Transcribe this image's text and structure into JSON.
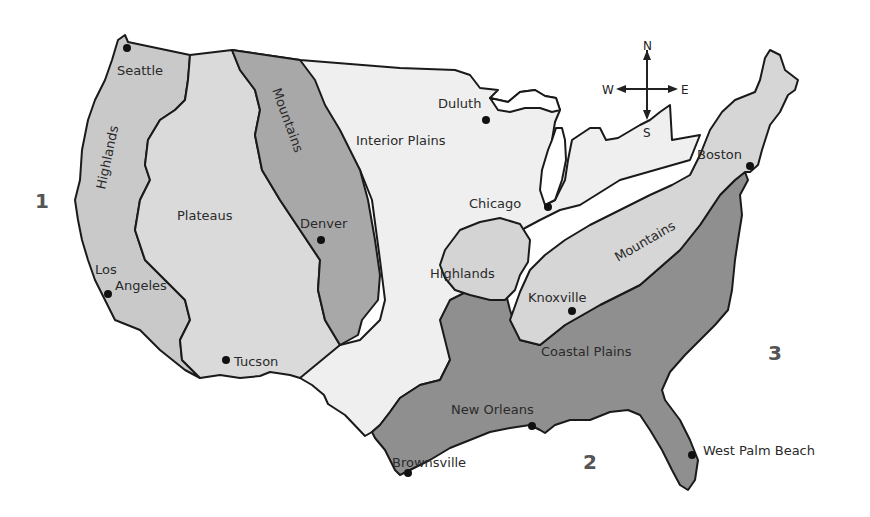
{
  "map": {
    "title": "Physical Regions of the United States",
    "colors": {
      "highlands_west": "#c9c9c9",
      "plateaus": "#dadada",
      "mountains_west": "#a8a8a8",
      "interior_plains": "#efefef",
      "highlands_central": "#d4d4d4",
      "mountains_east": "#d6d6d6",
      "coastal_plains": "#8f8f8f",
      "outline": "#1a1a1a",
      "background": "#ffffff"
    },
    "regions": [
      {
        "id": "highlands-west",
        "label": "Highlands"
      },
      {
        "id": "plateaus",
        "label": "Plateaus"
      },
      {
        "id": "mountains-west",
        "label": "Mountains"
      },
      {
        "id": "interior-plains",
        "label": "Interior Plains"
      },
      {
        "id": "highlands-central",
        "label": "Highlands"
      },
      {
        "id": "mountains-east",
        "label": "Mountains"
      },
      {
        "id": "coastal-plains",
        "label": "Coastal Plains"
      }
    ],
    "cities": [
      {
        "name": "Seattle"
      },
      {
        "name": "Los"
      },
      {
        "name": "Angeles"
      },
      {
        "name": "Tucson"
      },
      {
        "name": "Denver"
      },
      {
        "name": "Duluth"
      },
      {
        "name": "Chicago"
      },
      {
        "name": "Boston"
      },
      {
        "name": "Knoxville"
      },
      {
        "name": "New Orleans"
      },
      {
        "name": "Brownsville"
      },
      {
        "name": "West Palm Beach"
      }
    ],
    "water_markers": [
      {
        "label": "1"
      },
      {
        "label": "2"
      },
      {
        "label": "3"
      }
    ],
    "compass": {
      "north": "N",
      "south": "S",
      "east": "E",
      "west": "W"
    }
  }
}
